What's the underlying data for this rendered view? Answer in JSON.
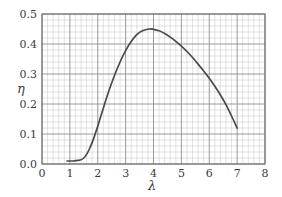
{
  "chart_data": {
    "type": "line",
    "title": "",
    "subtitle": "",
    "xlabel": "λ",
    "ylabel": "η",
    "xlim": [
      0,
      8
    ],
    "ylim": [
      0.0,
      0.5
    ],
    "grid": true,
    "minor_grid": true,
    "x_major_step": 1,
    "y_major_step": 0.1,
    "x_minor_divisions": 5,
    "y_minor_divisions": 5,
    "legend": null,
    "legend_position": "none",
    "xticks": [
      "0",
      "1",
      "2",
      "3",
      "4",
      "5",
      "6",
      "7",
      "8"
    ],
    "xtick_values": [
      0,
      1,
      2,
      3,
      4,
      5,
      6,
      7,
      8
    ],
    "yticks": [
      "0.0",
      "0.1",
      "0.2",
      "0.3",
      "0.4",
      "0.5"
    ],
    "ytick_values": [
      0.0,
      0.1,
      0.2,
      0.3,
      0.4,
      0.5
    ],
    "series": [
      {
        "name": "efficiency-curve",
        "color": "#4a4a4a",
        "x": [
          0.9,
          1.0,
          1.1,
          1.2,
          1.3,
          1.4,
          1.5,
          1.6,
          1.7,
          1.8,
          1.9,
          2.0,
          2.2,
          2.4,
          2.6,
          2.8,
          3.0,
          3.2,
          3.4,
          3.6,
          3.85,
          4.0,
          4.2,
          4.4,
          4.6,
          4.8,
          5.0,
          5.2,
          5.4,
          5.6,
          5.8,
          6.0,
          6.2,
          6.4,
          6.6,
          6.8,
          7.0
        ],
        "y": [
          0.01,
          0.01,
          0.01,
          0.011,
          0.012,
          0.014,
          0.02,
          0.032,
          0.05,
          0.072,
          0.098,
          0.126,
          0.186,
          0.244,
          0.295,
          0.34,
          0.378,
          0.408,
          0.431,
          0.444,
          0.45,
          0.449,
          0.444,
          0.435,
          0.423,
          0.409,
          0.393,
          0.375,
          0.355,
          0.333,
          0.31,
          0.286,
          0.259,
          0.23,
          0.198,
          0.16,
          0.12
        ]
      }
    ],
    "annotations": {
      "peak_lambda": 3.85,
      "peak_eta": 0.45,
      "start_lambda": 0.9,
      "start_eta": 0.01,
      "end_lambda": 7.0,
      "end_eta": 0.12
    },
    "colors": {
      "background": "#ffffff",
      "curve": "#4a4a4a",
      "major_grid": "#8f8f8f",
      "minor_grid": "#cfcfcf",
      "axis_border": "#6e6e6e",
      "text": "#3c3c3c"
    }
  }
}
